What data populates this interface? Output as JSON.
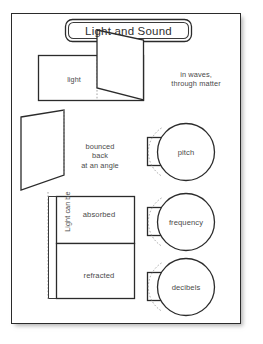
{
  "page": {
    "kind": "foldable-worksheet-template",
    "title": "Light and Sound"
  },
  "title_box": {
    "label": "Light and Sound"
  },
  "flaps": {
    "light": {
      "label": "light",
      "note": "in waves,\nthrough matter"
    },
    "reflected": {
      "note": "bounced\nback\nat an angle"
    },
    "absorbed": {
      "label": "absorbed"
    },
    "refracted": {
      "label": "refracted"
    },
    "side_label": "Light can be"
  },
  "circles": [
    {
      "label": "pitch"
    },
    {
      "label": "frequency"
    },
    {
      "label": "decibels"
    }
  ],
  "colors": {
    "ink": "#2b2b2b",
    "text": "#4a4a4a",
    "fold": "#9a9a9a",
    "paper": "#ffffff"
  }
}
